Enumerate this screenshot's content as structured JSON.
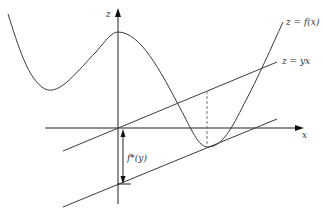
{
  "figure": {
    "type": "diagram",
    "axes": {
      "x_label": "x",
      "z_label": "z"
    },
    "curves": [
      {
        "id": "f",
        "label": "z = f(x)"
      },
      {
        "id": "yx",
        "label": "z = yx"
      }
    ],
    "annotations": {
      "gap_label": "f*(y)"
    },
    "colors": {
      "stroke": "#3a3a3a",
      "axis": "#222222",
      "dashed": "#777777",
      "background": "#ffffff"
    }
  }
}
